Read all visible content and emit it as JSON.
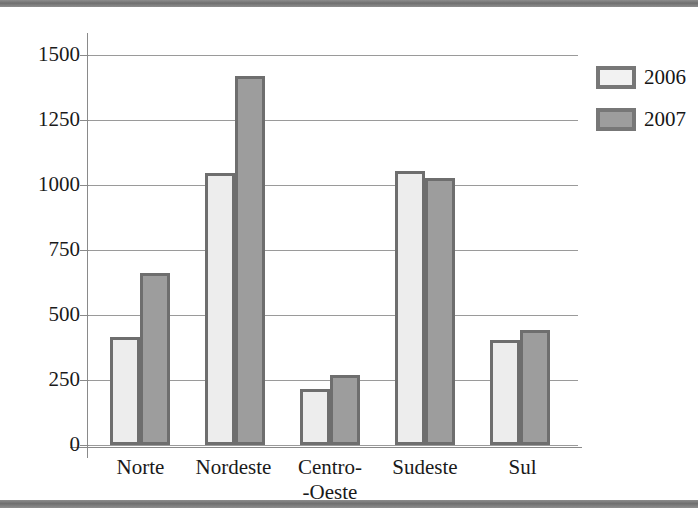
{
  "chart_data": {
    "type": "bar",
    "title": "",
    "subtitle": "",
    "xlabel": "",
    "ylabel": "",
    "categories": [
      "Norte",
      "Nordeste",
      "Centro--Oeste",
      "Sudeste",
      "Sul"
    ],
    "category_labels": [
      {
        "line1": "Norte",
        "line2": ""
      },
      {
        "line1": "Nordeste",
        "line2": ""
      },
      {
        "line1": "Centro-",
        "line2": "-Oeste"
      },
      {
        "line1": "Sudeste",
        "line2": ""
      },
      {
        "line1": "Sul",
        "line2": ""
      }
    ],
    "series": [
      {
        "name": "2006",
        "color": "#ededed",
        "values": [
          415,
          1045,
          215,
          1055,
          405
        ]
      },
      {
        "name": "2007",
        "color": "#9d9d9d",
        "values": [
          660,
          1420,
          270,
          1025,
          443
        ]
      }
    ],
    "ylim": [
      0,
      1500
    ],
    "ytick_labels": [
      "1500",
      "1250",
      "1000",
      "750",
      "500",
      "250",
      "0"
    ],
    "yticks": [
      1500,
      1250,
      1000,
      750,
      500,
      250,
      0
    ],
    "grid": true,
    "legend_position": "right",
    "legend": [
      {
        "label": "2006",
        "swatch": "light"
      },
      {
        "label": "2007",
        "swatch": "gray"
      }
    ]
  },
  "colors": {
    "series_2006_fill": "#ededed",
    "series_2007_fill": "#9d9d9d",
    "bar_border": "#6e6e6e",
    "gridline": "#9a9a9a",
    "axis": "#8a8a8a",
    "text": "#181818",
    "scan_band": "#6f6f6f"
  }
}
